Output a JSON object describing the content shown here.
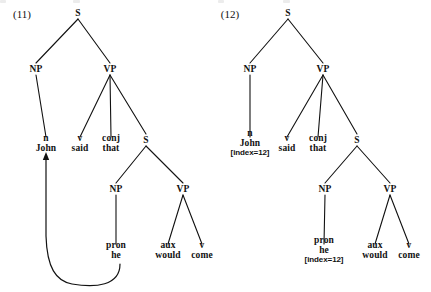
{
  "figure": {
    "kind": "syntax-parse-trees",
    "caption_visible": false,
    "ink_color": "#111111",
    "background_color": "#ffffff"
  },
  "examples": [
    {
      "id": "11",
      "label": "(11)",
      "label_x": 22,
      "label_y": 14,
      "annotation_style": "movement-arrow",
      "nodes": [
        {
          "key": "s_root",
          "cat": "S",
          "word": "",
          "index": "",
          "x": 78,
          "y": 13
        },
        {
          "key": "np1",
          "cat": "NP",
          "word": "",
          "index": "",
          "x": 36,
          "y": 69
        },
        {
          "key": "vp1",
          "cat": "VP",
          "word": "",
          "index": "",
          "x": 110,
          "y": 69
        },
        {
          "key": "n_john",
          "cat": "n",
          "word": "John",
          "index": "",
          "x": 46,
          "y": 143
        },
        {
          "key": "v_said",
          "cat": "v",
          "word": "said",
          "index": "",
          "x": 80,
          "y": 143
        },
        {
          "key": "c_that",
          "cat": "conj",
          "word": "that",
          "index": "",
          "x": 111,
          "y": 143
        },
        {
          "key": "s_emb",
          "cat": "S",
          "word": "",
          "index": "",
          "x": 146,
          "y": 140
        },
        {
          "key": "np2",
          "cat": "NP",
          "word": "",
          "index": "",
          "x": 116,
          "y": 189
        },
        {
          "key": "vp2",
          "cat": "VP",
          "word": "",
          "index": "",
          "x": 183,
          "y": 189
        },
        {
          "key": "pron_he",
          "cat": "pron",
          "word": "he",
          "index": "",
          "x": 116,
          "y": 250
        },
        {
          "key": "aux_wd",
          "cat": "aux",
          "word": "would",
          "index": "",
          "x": 168,
          "y": 250
        },
        {
          "key": "v_come",
          "cat": "v",
          "word": "come",
          "index": "",
          "x": 202,
          "y": 250
        }
      ],
      "edges": [
        {
          "from": "s_root",
          "to": "np1"
        },
        {
          "from": "s_root",
          "to": "vp1"
        },
        {
          "from": "np1",
          "to": "n_john"
        },
        {
          "from": "vp1",
          "to": "v_said"
        },
        {
          "from": "vp1",
          "to": "c_that"
        },
        {
          "from": "vp1",
          "to": "s_emb"
        },
        {
          "from": "s_emb",
          "to": "np2"
        },
        {
          "from": "s_emb",
          "to": "vp2"
        },
        {
          "from": "np2",
          "to": "pron_he"
        },
        {
          "from": "vp2",
          "to": "aux_wd"
        },
        {
          "from": "vp2",
          "to": "v_come"
        }
      ],
      "arrow": {
        "from_node": "pron_he",
        "to_node": "n_john",
        "path": "M 120 264 C 120 286, 95 288, 72 284 C 56 281, 47 268, 46 236 L 46 158",
        "head_x": 46,
        "head_y": 152
      }
    },
    {
      "id": "12",
      "label": "(12)",
      "label_x": 230,
      "label_y": 14,
      "annotation_style": "coindexing",
      "nodes": [
        {
          "key": "s_root",
          "cat": "S",
          "word": "",
          "index": "",
          "x": 288,
          "y": 13
        },
        {
          "key": "np1",
          "cat": "NP",
          "word": "",
          "index": "",
          "x": 250,
          "y": 69
        },
        {
          "key": "vp1",
          "cat": "VP",
          "word": "",
          "index": "",
          "x": 323,
          "y": 69
        },
        {
          "key": "n_john",
          "cat": "n",
          "word": "John",
          "index": "[index=12]",
          "x": 250,
          "y": 143
        },
        {
          "key": "v_said",
          "cat": "v",
          "word": "said",
          "index": "",
          "x": 287,
          "y": 143
        },
        {
          "key": "c_that",
          "cat": "conj",
          "word": "that",
          "index": "",
          "x": 318,
          "y": 143
        },
        {
          "key": "s_emb",
          "cat": "S",
          "word": "",
          "index": "",
          "x": 357,
          "y": 140
        },
        {
          "key": "np2",
          "cat": "NP",
          "word": "",
          "index": "",
          "x": 325,
          "y": 189
        },
        {
          "key": "vp2",
          "cat": "VP",
          "word": "",
          "index": "",
          "x": 390,
          "y": 189
        },
        {
          "key": "pron_he",
          "cat": "pron",
          "word": "he",
          "index": "[index=12]",
          "x": 324,
          "y": 250
        },
        {
          "key": "aux_wd",
          "cat": "aux",
          "word": "would",
          "index": "",
          "x": 375,
          "y": 250
        },
        {
          "key": "v_come",
          "cat": "v",
          "word": "come",
          "index": "",
          "x": 409,
          "y": 250
        }
      ],
      "edges": [
        {
          "from": "s_root",
          "to": "np1"
        },
        {
          "from": "s_root",
          "to": "vp1"
        },
        {
          "from": "np1",
          "to": "n_john"
        },
        {
          "from": "vp1",
          "to": "v_said"
        },
        {
          "from": "vp1",
          "to": "c_that"
        },
        {
          "from": "vp1",
          "to": "s_emb"
        },
        {
          "from": "s_emb",
          "to": "np2"
        },
        {
          "from": "s_emb",
          "to": "vp2"
        },
        {
          "from": "np2",
          "to": "pron_he"
        },
        {
          "from": "vp2",
          "to": "aux_wd"
        },
        {
          "from": "vp2",
          "to": "v_come"
        }
      ],
      "arrow": null
    }
  ]
}
